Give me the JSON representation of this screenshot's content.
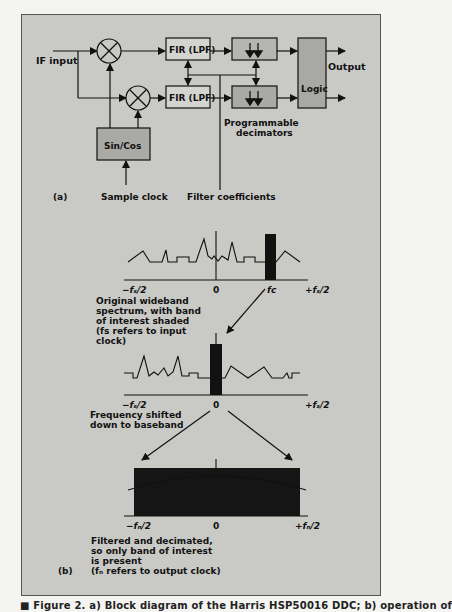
{
  "figure": {
    "panel_a": {
      "label": "(a)",
      "inputs": {
        "if_input": "IF input",
        "sample_clock": "Sample clock",
        "filter_coefficients": "Filter coefficients"
      },
      "blocks": {
        "mixer_top": "mixer",
        "mixer_bottom": "mixer",
        "fir_top": "FIR (LPF)",
        "fir_bottom": "FIR (LPF)",
        "nco": "Sin/Cos",
        "logic": "Logic"
      },
      "labels": {
        "output": "Output",
        "decimators_line1": "Programmable",
        "decimators_line2": "decimators"
      }
    },
    "panel_b": {
      "label": "(b)",
      "spectrum1": {
        "ticks": {
          "left": "−fₛ/2",
          "zero": "0",
          "fc": "fᴄ",
          "right": "+fₛ/2"
        },
        "caption_lines": [
          "Original wideband",
          "spectrum, with band",
          "of interest shaded",
          "(fs refers to input",
          "clock)"
        ]
      },
      "spectrum2": {
        "ticks": {
          "left": "−fₛ/2",
          "zero": "0",
          "right": "+fₛ/2"
        },
        "caption_lines": [
          "Frequency shifted",
          "down to baseband"
        ]
      },
      "spectrum3": {
        "ticks": {
          "left": "−fₙ/2",
          "zero": "0",
          "right": "+fₙ/2"
        },
        "caption_lines": [
          "Filtered and decimated,",
          "so only band of interest",
          "is present",
          "(fₙ refers to output clock)"
        ]
      }
    },
    "caption": "■ Figure 2. a) Block diagram of the Harris HSP50016 DDC; b) operation of"
  },
  "colors": {
    "paper": "#c9c9c6",
    "ink": "#111111",
    "block_fill": "#b9b9b5",
    "band": "#111111"
  }
}
